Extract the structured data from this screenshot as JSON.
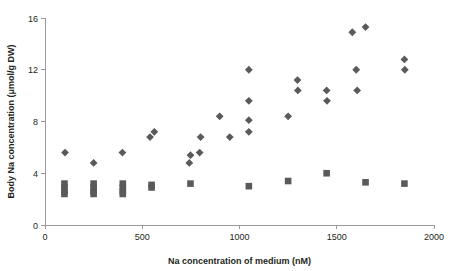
{
  "chart_data": {
    "type": "scatter",
    "title": "",
    "xlabel": "Na concentration of medium (nM)",
    "ylabel": "Body Na concentration (μmol/g DW)",
    "xlim": [
      0,
      2000
    ],
    "ylim": [
      0,
      16
    ],
    "xticks": [
      0,
      500,
      1000,
      1500,
      2000
    ],
    "yticks": [
      0,
      4,
      8,
      12,
      16
    ],
    "xtick_labels": [
      "0",
      "500",
      "1000",
      "1500",
      "2000"
    ],
    "ytick_labels": [
      "0",
      "4",
      "8",
      "12",
      "16"
    ],
    "grid": false,
    "legend": "none",
    "marker_color": "#5a5a5a",
    "axis_color": "#9a9a9a",
    "background": "#ffffff",
    "series": [
      {
        "name": "Body Na concentration",
        "marker": "diamond",
        "color": "#5a5a5a",
        "points": [
          [
            103,
            5.6
          ],
          [
            250,
            4.8
          ],
          [
            398,
            5.6
          ],
          [
            540,
            6.8
          ],
          [
            562,
            7.2
          ],
          [
            742,
            4.8
          ],
          [
            748,
            5.4
          ],
          [
            795,
            5.6
          ],
          [
            800,
            6.8
          ],
          [
            898,
            8.4
          ],
          [
            950,
            6.8
          ],
          [
            1048,
            12.0
          ],
          [
            1048,
            9.6
          ],
          [
            1048,
            8.1
          ],
          [
            1048,
            7.2
          ],
          [
            1250,
            8.4
          ],
          [
            1298,
            11.2
          ],
          [
            1300,
            10.4
          ],
          [
            1448,
            10.4
          ],
          [
            1450,
            9.6
          ],
          [
            1580,
            14.9
          ],
          [
            1600,
            12.0
          ],
          [
            1605,
            10.4
          ],
          [
            1648,
            15.3
          ],
          [
            1848,
            12.8
          ],
          [
            1850,
            12.0
          ]
        ]
      },
      {
        "name": "Medium Na concentration control",
        "marker": "square",
        "color": "#5a5a5a",
        "points": [
          [
            100,
            3.2
          ],
          [
            100,
            2.9
          ],
          [
            100,
            2.6
          ],
          [
            100,
            2.4
          ],
          [
            250,
            3.2
          ],
          [
            250,
            2.9
          ],
          [
            250,
            2.6
          ],
          [
            250,
            2.4
          ],
          [
            400,
            3.2
          ],
          [
            400,
            2.9
          ],
          [
            400,
            2.6
          ],
          [
            400,
            2.4
          ],
          [
            548,
            3.1
          ],
          [
            548,
            2.9
          ],
          [
            748,
            3.2
          ],
          [
            1048,
            3.0
          ],
          [
            1250,
            3.4
          ],
          [
            1448,
            4.0
          ],
          [
            1648,
            3.3
          ],
          [
            1848,
            3.2
          ]
        ]
      }
    ]
  }
}
